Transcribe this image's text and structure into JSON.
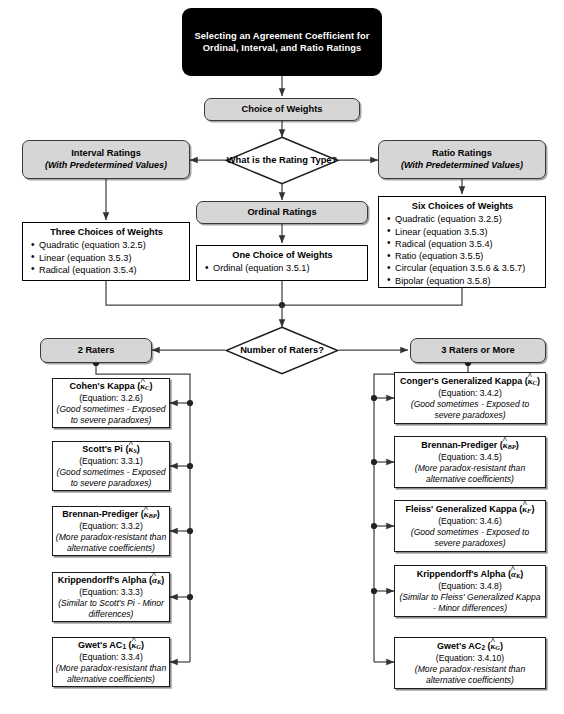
{
  "diagram": {
    "title": "Selecting an Agreement Coefficient for Ordinal, Interval, and Ratio Ratings",
    "choice_of_weights": "Choice of Weights",
    "decision_rating_type": "What is the Rating Type?",
    "decision_number_of_raters": "Number of Raters?",
    "interval": {
      "label": "Interval Ratings",
      "sub": "(With Predetermined Values)"
    },
    "ratio": {
      "label": "Ratio Ratings",
      "sub": "(With Predetermined Values)"
    },
    "ordinal": {
      "label": "Ordinal Ratings"
    },
    "three_choices": {
      "header": "Three Choices of  Weights",
      "items": [
        "Quadratic (equation 3.2.5)",
        "Linear (equation 3.5.3)",
        "Radical (equation 3.5.4)"
      ]
    },
    "one_choice": {
      "header": "One Choice of  Weights",
      "items": [
        "Ordinal (equation 3.5.1)"
      ]
    },
    "six_choices": {
      "header": "Six Choices of  Weights",
      "items": [
        "Quadratic (equation 3.2.5)",
        "Linear (equation 3.5.3)",
        "Radical (equation 3.5.4)",
        "Ratio (equation 3.5.5)",
        "Circular (equation 3.5.6 & 3.5.7)",
        "Bipolar (equation 3.5.8)"
      ]
    },
    "two_raters": "2 Raters",
    "three_or_more_raters": "3 Raters or More",
    "left_coefficients": [
      {
        "name": "Cohen's Kappa",
        "symbol_base": "κ",
        "symbol_sub": "C",
        "equation": "(Equation: 3.2.6)",
        "note": "(Good sometimes - Exposed to severe paradoxes)"
      },
      {
        "name": "Scott's Pi",
        "symbol_base": "κ",
        "symbol_sub": "S",
        "equation": "(Equation: 3.3.1)",
        "note": "(Good sometimes - Exposed to severe paradoxes)"
      },
      {
        "name": "Brennan-Prediger",
        "symbol_base": "κ",
        "symbol_sub": "BP",
        "equation": "(Equation: 3.3.2)",
        "note": "(More paradox-resistant than alternative coefficients)"
      },
      {
        "name": "Krippendorff's Alpha",
        "symbol_base": "α",
        "symbol_sub": "K",
        "equation": "(Equation: 3.3.3)",
        "note": "(Similar to Scott's Pi - Minor differences)"
      },
      {
        "name": "Gwet's AC",
        "name_sub": "1",
        "symbol_base": "κ",
        "symbol_sub": "G",
        "equation": "(Equation: 3.3.4)",
        "note": "(More paradox-resistant than alternative coefficients)"
      }
    ],
    "right_coefficients": [
      {
        "name": "Conger's Generalized Kappa",
        "symbol_base": "κ",
        "symbol_sub": "C",
        "equation": "(Equation: 3.4.2)",
        "note": "(Good sometimes - Exposed to severe paradoxes)"
      },
      {
        "name": "Brennan-Prediger",
        "symbol_base": "κ",
        "symbol_sub": "BP",
        "equation": "(Equation: 3.4.5)",
        "note": "(More paradox-resistant than alternative coefficients)"
      },
      {
        "name": "Fleiss' Generalized Kappa",
        "symbol_base": "κ",
        "symbol_sub": "F",
        "equation": "(Equation: 3.4.6)",
        "note": "(Good sometimes - Exposed to severe paradoxes)"
      },
      {
        "name": "Krippendorff's Alpha",
        "symbol_base": "α",
        "symbol_sub": "K",
        "equation": "(Equation: 3.4.8)",
        "note": "(Similar to Fleiss' Generalized Kappa - Minor differences)"
      },
      {
        "name": "Gwet's AC",
        "name_sub": "2",
        "symbol_base": "κ",
        "symbol_sub": "G",
        "equation": "(Equation: 3.4.10)",
        "note": "(More paradox-resistant than alternative coefficients)"
      }
    ],
    "colors": {
      "title_fill": "#000000",
      "stage_fill": "#d6d6d6",
      "box_fill": "#ffffff",
      "line": "#3a3a3a"
    }
  }
}
